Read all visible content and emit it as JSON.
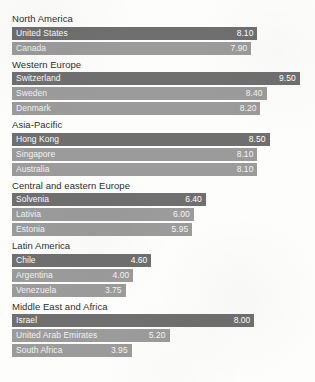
{
  "chart_data": {
    "type": "bar",
    "title": "",
    "xlabel": "",
    "ylabel": "",
    "xlim": [
      0,
      10
    ],
    "grid": false,
    "legend": null,
    "orientation": "horizontal",
    "value_format": "2-decimal",
    "colors": {
      "bar_primary": "#6f6f6f",
      "bar_secondary": "#9b9b9b",
      "background": "#fdfdfc",
      "group_title_text": "#2e2e2e",
      "bar_text": "#f2f2f2"
    },
    "groups": [
      {
        "name": "North America",
        "categories": [
          "United States",
          "Canada"
        ],
        "values": [
          8.1,
          7.9
        ]
      },
      {
        "name": "Western Europe",
        "categories": [
          "Switzerland",
          "Sweden",
          "Denmark"
        ],
        "values": [
          9.5,
          8.4,
          8.2
        ]
      },
      {
        "name": "Asia-Pacific",
        "categories": [
          "Hong Kong",
          "Singapore",
          "Australia"
        ],
        "values": [
          8.5,
          8.1,
          8.1
        ]
      },
      {
        "name": "Central and eastern Europe",
        "categories": [
          "Solvenia",
          "Lativia",
          "Estonia"
        ],
        "values": [
          6.4,
          6.0,
          5.95
        ]
      },
      {
        "name": "Latin America",
        "categories": [
          "Chile",
          "Argentina",
          "Venezuela"
        ],
        "values": [
          4.6,
          4.0,
          3.75
        ]
      },
      {
        "name": "Middle East and Africa",
        "categories": [
          "Israel",
          "United Arab Emirates",
          "South Africa"
        ],
        "values": [
          8.0,
          5.2,
          3.95
        ]
      }
    ]
  }
}
